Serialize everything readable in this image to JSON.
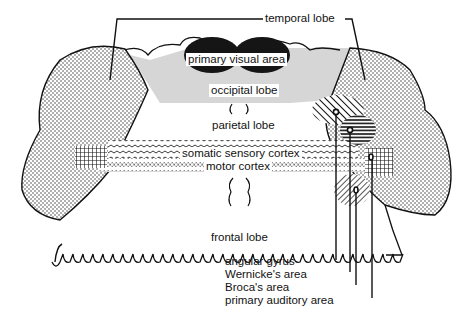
{
  "diagram": {
    "labels": {
      "temporal_lobe": "temporal lobe",
      "primary_visual_area": "primary visual area",
      "occipital_lobe": "occipital lobe",
      "parietal_lobe": "parietal lobe",
      "somatic_sensory_cortex": "somatic sensory cortex",
      "motor_cortex": "motor cortex",
      "frontal_lobe": "frontal lobe",
      "angular_gyrus": "angular gyrus",
      "wernickes_area": "Wernicke's area",
      "brocas_area": "Broca's area",
      "primary_auditory_area": "primary auditory area"
    },
    "legend_callouts": [
      "angular gyrus",
      "Wernicke's area",
      "Broca's area",
      "primary auditory area"
    ],
    "fills": {
      "temporal_lobe": "stippled dots",
      "occipital_lobe": "#d6d6d6",
      "primary_visual_area": "#1a1a1a",
      "somatic_sensory_cortex": "wavy lines",
      "motor_cortex": "zigzag dotted",
      "angular_gyrus": "diagonal hatch",
      "wernickes_area": "horizontal hatch",
      "brocas_area": "diagonal hatch",
      "primary_auditory_area": "cross hatch"
    }
  }
}
